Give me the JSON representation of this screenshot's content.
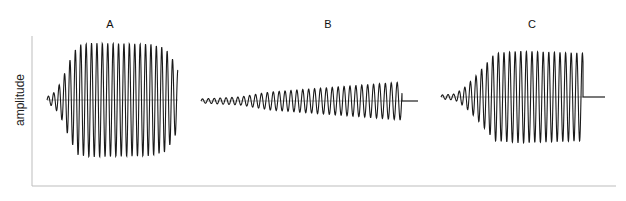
{
  "chart_data": {
    "type": "line",
    "title": "",
    "xlabel": "",
    "ylabel": "amplitude",
    "grid": false,
    "legend": null,
    "axes": {
      "x0": 32,
      "y_top": 36,
      "y_bottom": 186,
      "x_end": 616,
      "color": "#bdbdbd"
    },
    "panels": [
      {
        "label": "A",
        "label_x": 110,
        "label_y": 18,
        "x_start": 47,
        "x_end": 178,
        "baseline_y": 100,
        "tail_end": 178,
        "period": 5.4,
        "amp_max": 57,
        "envelope": [
          [
            47,
            3
          ],
          [
            55,
            8
          ],
          [
            62,
            20
          ],
          [
            70,
            40
          ],
          [
            78,
            55
          ],
          [
            90,
            57
          ],
          [
            150,
            56
          ],
          [
            165,
            52
          ],
          [
            172,
            42
          ],
          [
            178,
            30
          ]
        ],
        "description": "Fast onset, sustained high amplitude, tapering end"
      },
      {
        "label": "B",
        "label_x": 328,
        "label_y": 18,
        "x_start": 201,
        "x_end": 402,
        "baseline_y": 101,
        "tail_end": 418,
        "period": 5.9,
        "amp_max": 18,
        "envelope": [
          [
            201,
            2
          ],
          [
            240,
            4
          ],
          [
            270,
            9
          ],
          [
            310,
            12
          ],
          [
            350,
            15
          ],
          [
            402,
            19
          ]
        ],
        "description": "Slow gradual rise in amplitude, abrupt stop, flat tail"
      },
      {
        "label": "C",
        "label_x": 532,
        "label_y": 18,
        "x_start": 441,
        "x_end": 583,
        "baseline_y": 97,
        "tail_end": 605,
        "period": 5.6,
        "amp_max": 46,
        "envelope": [
          [
            441,
            2
          ],
          [
            455,
            3
          ],
          [
            465,
            10
          ],
          [
            475,
            20
          ],
          [
            485,
            32
          ],
          [
            495,
            44
          ],
          [
            520,
            46
          ],
          [
            583,
            44
          ]
        ],
        "description": "Moderate onset, sustained high amplitude, abrupt stop, flat tail"
      }
    ]
  }
}
